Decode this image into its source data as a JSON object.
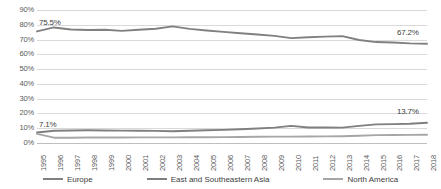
{
  "chart_data": {
    "type": "line",
    "title": "",
    "xlabel": "",
    "ylabel": "",
    "ylim": [
      0,
      90
    ],
    "yticks": [
      "0%",
      "10%",
      "20%",
      "30%",
      "40%",
      "50%",
      "60%",
      "70%",
      "80%",
      "90%"
    ],
    "ytick_values": [
      0,
      10,
      20,
      30,
      40,
      50,
      60,
      70,
      80,
      90
    ],
    "grid": true,
    "legend_position": "bottom",
    "categories": [
      "1995",
      "1996",
      "1997",
      "1998",
      "1999",
      "2000",
      "2001",
      "2002",
      "2003",
      "2004",
      "2005",
      "2006",
      "2007",
      "2008",
      "2009",
      "2010",
      "2011",
      "2012",
      "2013",
      "2014",
      "2015",
      "2016",
      "2017",
      "2018"
    ],
    "series": [
      {
        "name": "Europe",
        "color": "#808080",
        "values": [
          75.5,
          78.2,
          76.8,
          76.5,
          76.6,
          75.9,
          76.6,
          77.3,
          78.9,
          77.2,
          76.1,
          75.2,
          74.3,
          73.4,
          72.5,
          71.0,
          71.6,
          72.0,
          72.3,
          69.7,
          68.3,
          68.0,
          67.4,
          67.2
        ]
      },
      {
        "name": "East and Southeastern Asia",
        "color": "#7f7f7f",
        "values": [
          7.1,
          8.3,
          8.5,
          8.6,
          8.5,
          8.4,
          8.3,
          8.2,
          8.0,
          8.3,
          8.6,
          8.9,
          9.3,
          9.8,
          10.4,
          11.6,
          10.5,
          10.5,
          10.4,
          11.6,
          12.6,
          12.8,
          13.0,
          13.7
        ]
      },
      {
        "name": "North America",
        "color": "#a6a6a6",
        "values": [
          6.2,
          3.6,
          3.6,
          3.7,
          3.7,
          3.7,
          3.8,
          3.8,
          3.8,
          3.9,
          3.9,
          4.0,
          4.1,
          4.2,
          4.3,
          4.3,
          4.4,
          4.5,
          4.6,
          4.9,
          5.3,
          5.4,
          5.5,
          5.6
        ]
      }
    ],
    "annotations": [
      {
        "text": "75.5%",
        "series": "Europe",
        "category": "1995"
      },
      {
        "text": "67.2%",
        "series": "Europe",
        "category": "2018"
      },
      {
        "text": "7.1%",
        "series": "East and Southeastern Asia",
        "category": "1995"
      },
      {
        "text": "13.7%",
        "series": "East and Southeastern Asia",
        "category": "2018"
      }
    ]
  },
  "legend": {
    "items": [
      {
        "label": "Europe",
        "color": "#808080"
      },
      {
        "label": "East and Southeastern Asia",
        "color": "#7f7f7f"
      },
      {
        "label": "North America",
        "color": "#a6a6a6"
      }
    ]
  }
}
